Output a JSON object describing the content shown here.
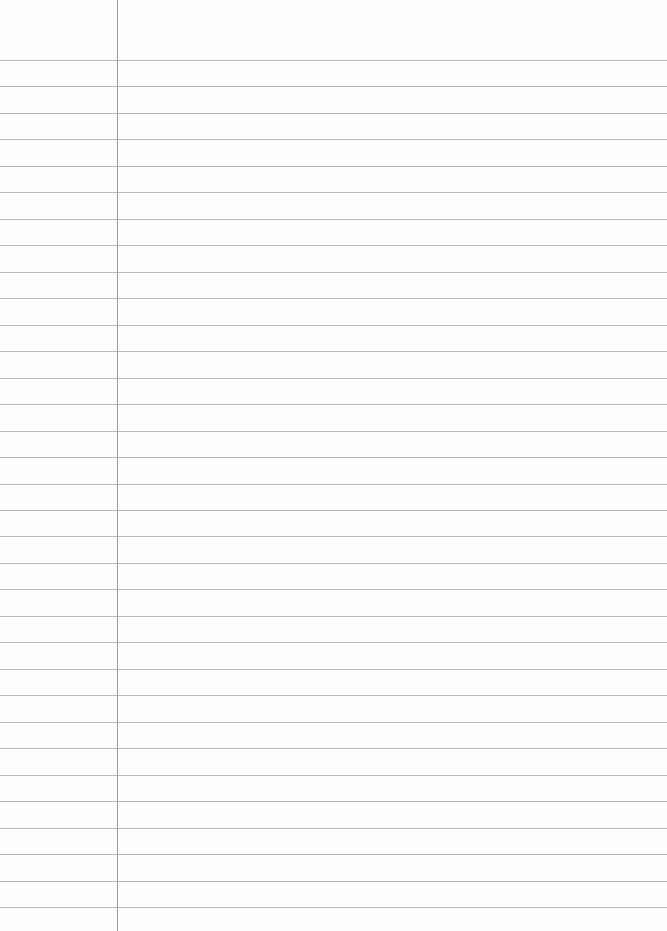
{
  "paper": {
    "type": "lined-notebook-page",
    "rule_count": 33,
    "first_rule_y": 60,
    "rule_spacing": 26.47,
    "margin_x": 117,
    "rule_color": "#b9b9b9",
    "margin_color": "#9a9a9a",
    "background": "#fefefe"
  }
}
